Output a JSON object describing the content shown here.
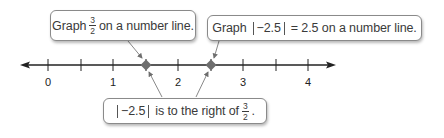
{
  "callouts": {
    "graph_three_halves": {
      "prefix": "Graph",
      "frac_num": "3",
      "frac_den": "2",
      "suffix": "on a number line."
    },
    "graph_abs": {
      "prefix": "Graph",
      "abs_content": "−2.5",
      "equals": "= 2.5 on a number line."
    },
    "comparison": {
      "abs_content": "−2.5",
      "middle": "is to the right of",
      "frac_num": "3",
      "frac_den": "2",
      "end": "."
    }
  },
  "number_line": {
    "tick_labels": [
      "0",
      "1",
      "2",
      "3",
      "4"
    ],
    "points": [
      {
        "label": "3/2",
        "value": 1.5
      },
      {
        "label": "|−2.5|",
        "value": 2.5
      }
    ]
  },
  "colors": {
    "line": "#222222",
    "point": "#6e6e6e",
    "leader": "#7a7a7a",
    "border": "#8a8a8a"
  }
}
